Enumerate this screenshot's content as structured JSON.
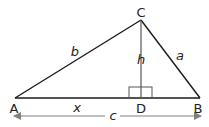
{
  "diagram": {
    "type": "triangle-with-altitude",
    "vertices": {
      "A": {
        "label": "A",
        "x": 15,
        "y": 98
      },
      "B": {
        "label": "B",
        "x": 200,
        "y": 98
      },
      "C": {
        "label": "C",
        "x": 141,
        "y": 20
      },
      "D": {
        "label": "D",
        "x": 141,
        "y": 98
      }
    },
    "sides": {
      "b": {
        "label": "b",
        "from": "A",
        "to": "C"
      },
      "a": {
        "label": "a",
        "from": "C",
        "to": "B"
      },
      "h": {
        "label": "h",
        "from": "C",
        "to": "D"
      },
      "x": {
        "label": "x",
        "from": "A",
        "to": "D"
      },
      "c": {
        "label": "c",
        "from": "A",
        "to": "B"
      }
    },
    "right_angle_marker": {
      "at": "D"
    },
    "colors": {
      "line": "#1a1a1a",
      "altitude": "#555555",
      "dimension_arrow": "#808080",
      "text": "#222222"
    }
  }
}
